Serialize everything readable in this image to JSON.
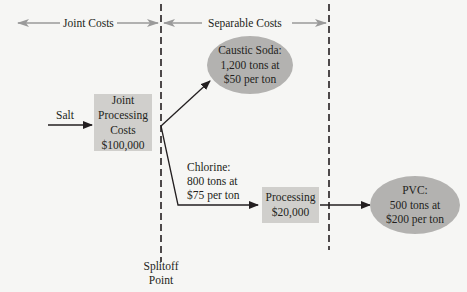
{
  "headers": {
    "joint_costs": "Joint Costs",
    "separable_costs": "Separable Costs"
  },
  "input": {
    "label": "Salt"
  },
  "joint_process": {
    "lines": [
      "Joint",
      "Processing",
      "Costs",
      "$100,000"
    ]
  },
  "products": {
    "caustic_soda": {
      "lines": [
        "Caustic Soda:",
        "1,200 tons at",
        "$50 per ton"
      ]
    },
    "chlorine": {
      "lines": [
        "Chlorine:",
        "800 tons at",
        "$75 per ton"
      ]
    },
    "pvc": {
      "lines": [
        "PVC:",
        "500 tons at",
        "$200 per ton"
      ]
    }
  },
  "further_processing": {
    "lines": [
      "Processing",
      "$20,000"
    ]
  },
  "splitoff": {
    "lines": [
      "Splitoff",
      "Point"
    ]
  },
  "colors": {
    "box_fill": "#d0cfcc",
    "ellipse_fill": "#b3b2b0",
    "header_arrow": "#9a9a9a",
    "line": "#231f20"
  }
}
